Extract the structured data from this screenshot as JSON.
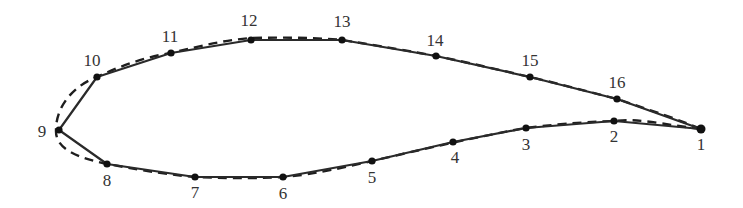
{
  "diagram": {
    "nodes": [
      {
        "id": 1,
        "label": "1"
      },
      {
        "id": 2,
        "label": "2"
      },
      {
        "id": 3,
        "label": "3"
      },
      {
        "id": 4,
        "label": "4"
      },
      {
        "id": 5,
        "label": "5"
      },
      {
        "id": 6,
        "label": "6"
      },
      {
        "id": 7,
        "label": "7"
      },
      {
        "id": 8,
        "label": "8"
      },
      {
        "id": 9,
        "label": "9"
      },
      {
        "id": 10,
        "label": "10"
      },
      {
        "id": 11,
        "label": "11"
      },
      {
        "id": 12,
        "label": "12"
      },
      {
        "id": 13,
        "label": "13"
      },
      {
        "id": 14,
        "label": "14"
      },
      {
        "id": 15,
        "label": "15"
      },
      {
        "id": 16,
        "label": "16"
      }
    ],
    "line_styles": {
      "panel_polygon": "solid",
      "true_contour": "dashed"
    },
    "colors": {
      "line": "#2a2a2a",
      "node": "#111111",
      "label": "#333333",
      "background": "#ffffff"
    }
  }
}
